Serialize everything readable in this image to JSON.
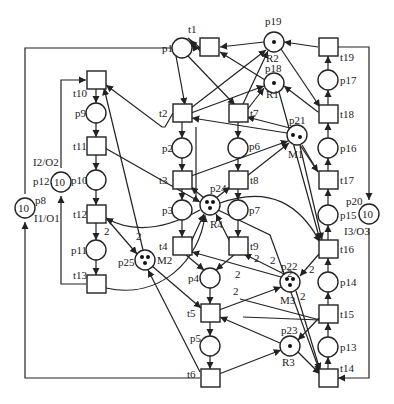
{
  "places": [
    {
      "id": "p1",
      "label": "p1",
      "x": 182,
      "y": 48,
      "tokens": 0
    },
    {
      "id": "p2",
      "label": "p2",
      "x": 182,
      "y": 148,
      "tokens": 0
    },
    {
      "id": "p3",
      "label": "p3",
      "x": 182,
      "y": 210,
      "tokens": 0
    },
    {
      "id": "p4",
      "label": "p4",
      "x": 210,
      "y": 278,
      "tokens": 0
    },
    {
      "id": "p5",
      "label": "p5",
      "x": 210,
      "y": 346,
      "tokens": 0
    },
    {
      "id": "p6",
      "label": "p6",
      "x": 238,
      "y": 148,
      "tokens": 0
    },
    {
      "id": "p7",
      "label": "p7",
      "x": 238,
      "y": 210,
      "tokens": 0
    },
    {
      "id": "p9",
      "label": "p9",
      "x": 96,
      "y": 113,
      "tokens": 0
    },
    {
      "id": "p10",
      "label": "p10",
      "x": 96,
      "y": 180,
      "tokens": 0
    },
    {
      "id": "p11",
      "label": "p11",
      "x": 96,
      "y": 250,
      "tokens": 0
    },
    {
      "id": "p13",
      "label": "p13",
      "x": 328,
      "y": 347,
      "tokens": 0
    },
    {
      "id": "p14",
      "label": "p14",
      "x": 328,
      "y": 282,
      "tokens": 0
    },
    {
      "id": "p15",
      "label": "p15",
      "x": 328,
      "y": 215,
      "tokens": 0
    },
    {
      "id": "p16",
      "label": "p16",
      "x": 328,
      "y": 148,
      "tokens": 0
    },
    {
      "id": "p17",
      "label": "p17",
      "x": 328,
      "y": 80,
      "tokens": 0
    },
    {
      "id": "p18",
      "label": "p18",
      "x": 274,
      "y": 83,
      "tokens": 1,
      "resource": "R1"
    },
    {
      "id": "p19",
      "label": "p19",
      "x": 274,
      "y": 42,
      "tokens": 1,
      "resource": "R2"
    },
    {
      "id": "p21",
      "label": "p21",
      "x": 297,
      "y": 135,
      "tokens": 2,
      "resource": "M1"
    },
    {
      "id": "p22",
      "label": "p22",
      "x": 290,
      "y": 282,
      "tokens": 3,
      "resource": "M3"
    },
    {
      "id": "p23",
      "label": "p23",
      "x": 290,
      "y": 346,
      "tokens": 1,
      "resource": "R3"
    },
    {
      "id": "p24",
      "label": "p24",
      "x": 210,
      "y": 205,
      "tokens": 3,
      "resource": "R4"
    },
    {
      "id": "p25",
      "label": "p25",
      "x": 145,
      "y": 260,
      "tokens": 3,
      "resource": "M2"
    }
  ],
  "io_places": [
    {
      "id": "p8",
      "label": "p8",
      "value": "10",
      "io": "I1/O1",
      "x": 25,
      "y": 208
    },
    {
      "id": "p12",
      "label": "p12",
      "value": "10",
      "io": "I2/O2",
      "x": 61,
      "y": 182
    },
    {
      "id": "p20",
      "label": "p20",
      "value": "10",
      "io": "I3/O3",
      "x": 369,
      "y": 214
    }
  ],
  "transitions": [
    {
      "id": "t1",
      "label": "t1",
      "x": 210,
      "y": 47
    },
    {
      "id": "t2",
      "label": "t2",
      "x": 182,
      "y": 113
    },
    {
      "id": "t3",
      "label": "t3",
      "x": 182,
      "y": 180
    },
    {
      "id": "t4",
      "label": "t4",
      "x": 182,
      "y": 246
    },
    {
      "id": "t5",
      "label": "t5",
      "x": 210,
      "y": 313
    },
    {
      "id": "t6",
      "label": "t6",
      "x": 210,
      "y": 378
    },
    {
      "id": "t7",
      "label": "t7",
      "x": 238,
      "y": 113
    },
    {
      "id": "t8",
      "label": "t8",
      "x": 238,
      "y": 180
    },
    {
      "id": "t9",
      "label": "t9",
      "x": 238,
      "y": 246
    },
    {
      "id": "t10",
      "label": "t10",
      "x": 96,
      "y": 80
    },
    {
      "id": "t11",
      "label": "t11",
      "x": 96,
      "y": 146
    },
    {
      "id": "t12",
      "label": "t12",
      "x": 96,
      "y": 214
    },
    {
      "id": "t13",
      "label": "t13",
      "x": 96,
      "y": 284
    },
    {
      "id": "t14",
      "label": "t14",
      "x": 328,
      "y": 378
    },
    {
      "id": "t15",
      "label": "t15",
      "x": 328,
      "y": 314
    },
    {
      "id": "t16",
      "label": "t16",
      "x": 328,
      "y": 249
    },
    {
      "id": "t17",
      "label": "t17",
      "x": 328,
      "y": 180
    },
    {
      "id": "t18",
      "label": "t18",
      "x": 328,
      "y": 114
    },
    {
      "id": "t19",
      "label": "t19",
      "x": 328,
      "y": 47
    }
  ],
  "arc_weights": [
    "2",
    "2",
    "2",
    "2",
    "2",
    "2",
    "2",
    "2",
    "2"
  ],
  "caption": "图 2 ..."
}
